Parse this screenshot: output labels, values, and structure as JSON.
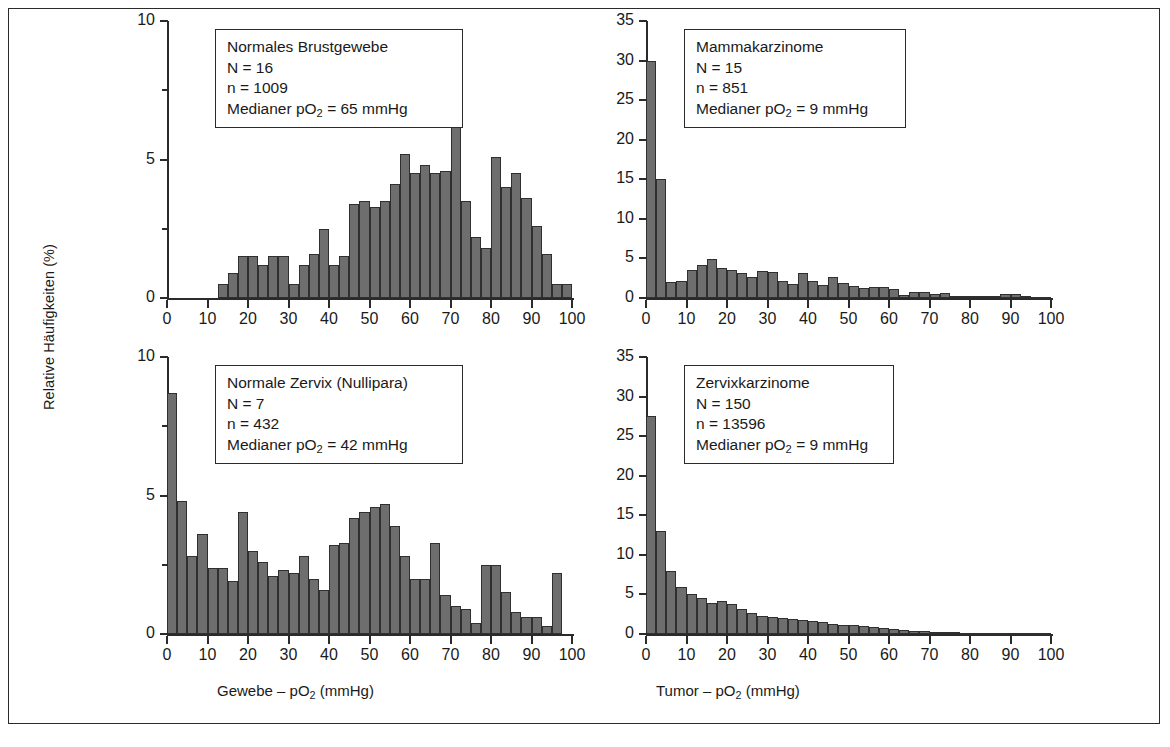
{
  "figure": {
    "y_axis_label": "Relative Häufigkeiten (%)",
    "x_title_left": "Gewebe – pO2 (mmHg)",
    "x_title_right": "Tumor – pO2 (mmHg)",
    "bar_color": "#6e6e6e",
    "bar_edge_color": "#2f2f2f",
    "frame_color": "#2b2b2b"
  },
  "labels": {
    "x_gewebe_pre": "Gewebe – pO",
    "x_gewebe_sub": "2",
    "x_gewebe_post": " (mmHg)",
    "x_tumor_pre": "Tumor – pO",
    "x_tumor_sub": "2",
    "x_tumor_post": " (mmHg)",
    "median_pre": "Medianer pO",
    "median_sub": "2",
    "n_big_label": "N = ",
    "n_small_label": "n = "
  },
  "chart_data": [
    {
      "id": "normales-brustgewebe",
      "type": "bar",
      "title": "Normales Brustgewebe",
      "N": 16,
      "n": 1009,
      "median_pO2_mmHg": 65,
      "median_text": "Medianer pO2 = 65 mmHg",
      "n_text": "N = 16",
      "n_small_text": "n = 1009",
      "xlabel": "Gewebe – pO2 (mmHg)",
      "ylabel": "Relative Häufigkeiten (%)",
      "xlim": [
        0,
        100
      ],
      "ylim": [
        0,
        10
      ],
      "yticks": [
        0,
        5,
        10
      ],
      "yticks_minor": [
        2.5,
        7.5
      ],
      "xticks": [
        0,
        10,
        20,
        30,
        40,
        50,
        60,
        70,
        80,
        90,
        100
      ],
      "bin_width": 2.5,
      "bin_starts": [
        12.5,
        15,
        17.5,
        20,
        22.5,
        25,
        27.5,
        30,
        32.5,
        35,
        37.5,
        40,
        42.5,
        45,
        47.5,
        50,
        52.5,
        55,
        57.5,
        60,
        62.5,
        65,
        67.5,
        70,
        72.5,
        75,
        77.5,
        80,
        82.5,
        85,
        87.5,
        90,
        92.5,
        95,
        97.5
      ],
      "values": [
        0.5,
        0.9,
        1.5,
        1.5,
        1.2,
        1.5,
        1.5,
        0.5,
        1.2,
        1.6,
        2.5,
        1.2,
        1.5,
        3.4,
        3.5,
        3.3,
        3.5,
        4.1,
        5.2,
        4.5,
        4.8,
        4.5,
        4.6,
        7.1,
        3.5,
        2.2,
        1.8,
        5.1,
        4.0,
        4.5,
        3.6,
        2.6,
        1.6,
        0.5,
        0.5
      ]
    },
    {
      "id": "mammakarzinome",
      "type": "bar",
      "title": "Mammakarzinome",
      "N": 15,
      "n": 851,
      "median_pO2_mmHg": 9,
      "median_text": "Medianer pO2 = 9 mmHg",
      "n_text": "N = 15",
      "n_small_text": "n = 851",
      "xlabel": "Tumor – pO2 (mmHg)",
      "ylabel": "Relative Häufigkeiten (%)",
      "xlim": [
        0,
        100
      ],
      "ylim": [
        0,
        35
      ],
      "yticks": [
        0,
        5,
        10,
        15,
        20,
        25,
        30,
        35
      ],
      "xticks": [
        0,
        10,
        20,
        30,
        40,
        50,
        60,
        70,
        80,
        90,
        100
      ],
      "bin_width": 2.5,
      "bin_starts": [
        0,
        2.5,
        5,
        7.5,
        10,
        12.5,
        15,
        17.5,
        20,
        22.5,
        25,
        27.5,
        30,
        32.5,
        35,
        37.5,
        40,
        42.5,
        45,
        47.5,
        50,
        52.5,
        55,
        57.5,
        60,
        62.5,
        65,
        67.5,
        70,
        72.5,
        75,
        77.5,
        80,
        82.5,
        85,
        87.5,
        90,
        92.5,
        95,
        97.5
      ],
      "values": [
        30,
        15,
        2,
        2.2,
        3.5,
        4.2,
        4.9,
        3.8,
        3.5,
        3.2,
        2.7,
        3.4,
        3.3,
        2.2,
        1.8,
        3.2,
        2.2,
        1.6,
        2.6,
        1.9,
        1.5,
        1.3,
        1.4,
        1.4,
        1.2,
        0.4,
        0.8,
        0.8,
        0.5,
        0.6,
        0.3,
        0.3,
        0.3,
        0.2,
        0.3,
        0.5,
        0.5,
        0.2,
        0.1,
        0.1
      ]
    },
    {
      "id": "normale-zervix-nullipara",
      "type": "bar",
      "title": "Normale Zervix (Nullipara)",
      "N": 7,
      "n": 432,
      "median_pO2_mmHg": 42,
      "median_text": "Medianer pO2 = 42 mmHg",
      "n_text": "N = 7",
      "n_small_text": "n = 432",
      "xlabel": "Gewebe – pO2 (mmHg)",
      "ylabel": "Relative Häufigkeiten (%)",
      "xlim": [
        0,
        100
      ],
      "ylim": [
        0,
        10
      ],
      "yticks": [
        0,
        5,
        10
      ],
      "yticks_minor": [
        2.5,
        7.5
      ],
      "xticks": [
        0,
        10,
        20,
        30,
        40,
        50,
        60,
        70,
        80,
        90,
        100
      ],
      "bin_width": 2.5,
      "bin_starts": [
        0,
        2.5,
        5,
        7.5,
        10,
        12.5,
        15,
        17.5,
        20,
        22.5,
        25,
        27.5,
        30,
        32.5,
        35,
        37.5,
        40,
        42.5,
        45,
        47.5,
        50,
        52.5,
        55,
        57.5,
        60,
        62.5,
        65,
        67.5,
        70,
        72.5,
        75,
        77.5,
        80,
        82.5,
        85,
        87.5,
        90,
        92.5,
        95,
        97.5
      ],
      "values": [
        8.7,
        4.8,
        2.8,
        3.6,
        2.4,
        2.4,
        1.9,
        4.4,
        3.0,
        2.6,
        2.1,
        2.3,
        2.2,
        2.8,
        2.0,
        1.6,
        3.2,
        3.3,
        4.2,
        4.4,
        4.6,
        4.7,
        3.9,
        2.8,
        2.0,
        2.0,
        3.3,
        1.4,
        1.0,
        0.9,
        0.4,
        2.5,
        2.5,
        1.5,
        0.8,
        0.6,
        0.6,
        0.3,
        2.2,
        0
      ]
    },
    {
      "id": "zervixkarzinome",
      "type": "bar",
      "title": "Zervixkarzinome",
      "N": 150,
      "n": 13596,
      "median_pO2_mmHg": 9,
      "median_text": "Medianer pO2 = 9 mmHg",
      "n_text": "N = 150",
      "n_small_text": "n = 13596",
      "xlabel": "Tumor – pO2 (mmHg)",
      "ylabel": "Relative Häufigkeiten (%)",
      "xlim": [
        0,
        100
      ],
      "ylim": [
        0,
        35
      ],
      "yticks": [
        0,
        5,
        10,
        15,
        20,
        25,
        30,
        35
      ],
      "xticks": [
        0,
        10,
        20,
        30,
        40,
        50,
        60,
        70,
        80,
        90,
        100
      ],
      "bin_width": 2.5,
      "bin_starts": [
        0,
        2.5,
        5,
        7.5,
        10,
        12.5,
        15,
        17.5,
        20,
        22.5,
        25,
        27.5,
        30,
        32.5,
        35,
        37.5,
        40,
        42.5,
        45,
        47.5,
        50,
        52.5,
        55,
        57.5,
        60,
        62.5,
        65,
        67.5,
        70,
        72.5,
        75,
        77.5,
        80,
        82.5,
        85,
        87.5,
        90,
        92.5,
        95,
        97.5
      ],
      "values": [
        27.5,
        13,
        8,
        6,
        5,
        4.6,
        3.9,
        4.2,
        3.8,
        3.2,
        2.6,
        2.3,
        2.1,
        2.0,
        1.9,
        1.8,
        1.6,
        1.5,
        1.3,
        1.2,
        1.1,
        1.0,
        0.9,
        0.8,
        0.6,
        0.5,
        0.4,
        0.35,
        0.3,
        0.25,
        0.2,
        0.18,
        0.15,
        0.12,
        0.1,
        0.1,
        0.08,
        0.06,
        0.05,
        0.05
      ]
    }
  ]
}
